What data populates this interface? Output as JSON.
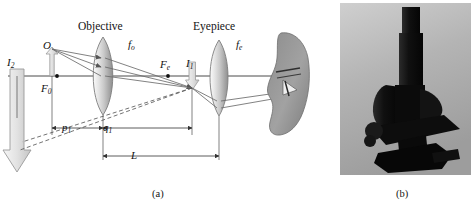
{
  "figure": {
    "panel_a": {
      "caption": "(a)",
      "headings": {
        "objective": "Objective",
        "eyepiece": "Eyepiece"
      },
      "labels": [
        {
          "name": "object-label",
          "text": "O",
          "sub": "",
          "x": 43,
          "y": 40
        },
        {
          "name": "objective-focal-label",
          "text": "f",
          "sub": "o",
          "x": 128,
          "y": 39
        },
        {
          "name": "eyepiece-focal-label",
          "text": "f",
          "sub": "e",
          "x": 236,
          "y": 39
        },
        {
          "name": "objective-front-focus",
          "text": "F",
          "sub": "0",
          "x": 41,
          "y": 83
        },
        {
          "name": "eyepiece-focus-label",
          "text": "F",
          "sub": "e",
          "x": 160,
          "y": 59
        },
        {
          "name": "intermediate-image-label",
          "text": "I",
          "sub": "1",
          "x": 186,
          "y": 58
        },
        {
          "name": "final-image-label",
          "text": "I",
          "sub": "2",
          "x": 7,
          "y": 57
        }
      ],
      "dimensions": [
        {
          "name": "object-distance",
          "text": "p",
          "sub": "1",
          "x": 62,
          "y": 122
        },
        {
          "name": "image-distance",
          "text": "q",
          "sub": "1",
          "x": 103,
          "y": 122
        },
        {
          "name": "tube-length",
          "text": "L",
          "sub": "",
          "x": 131,
          "y": 152
        }
      ],
      "colors": {
        "axis": "#4a4a4a",
        "ray": "#6b6b6b",
        "lens_fill_light": "#f2f2f2",
        "lens_fill_dark": "#9e9e9e",
        "arrow_fill": "#dcdcdc",
        "arrow_stroke": "#8c8c8c",
        "face_fill": "#9a9a9a",
        "dashed_ray": "#5a5a5a"
      }
    },
    "panel_b": {
      "caption": "(b)",
      "alt": "photograph of a compound optical microscope",
      "colors": {
        "background": "#b9b9b9",
        "instrument": "#1e1e1e"
      }
    }
  }
}
